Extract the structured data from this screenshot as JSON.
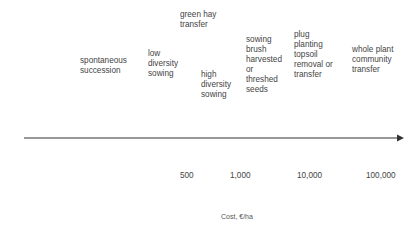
{
  "diagram": {
    "methods": [
      {
        "id": "spontaneous-succession",
        "label": "spontaneous\nsuccession"
      },
      {
        "id": "low-diversity-sowing",
        "label": "low\ndiversity\nsowing"
      },
      {
        "id": "green-hay-transfer",
        "label": "green hay\ntransfer"
      },
      {
        "id": "high-diversity-sowing",
        "label": "high\ndiversity\nsowing"
      },
      {
        "id": "sowing-brush-harvested",
        "label": "sowing\nbrush\nharvested\nor\nthreshed\nseeds"
      },
      {
        "id": "plug-planting-topsoil",
        "label": "plug\nplanting\ntopsoil\nremoval or\ntransfer"
      },
      {
        "id": "whole-plant-community-transfer",
        "label": "whole plant\ncommunity\ntransfer"
      }
    ],
    "axis": {
      "ticks": [
        "500",
        "1,000",
        "10,000",
        "100,000"
      ],
      "title": "Cost, €/ha",
      "color": "#333333"
    }
  }
}
